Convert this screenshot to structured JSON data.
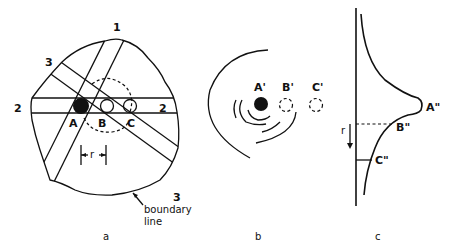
{
  "figure": {
    "panel_a": {
      "caption": "a",
      "projection_labels": {
        "p1": "1",
        "p2_left": "2",
        "p2_right": "2",
        "p3_top": "3",
        "p3_bottom": "3"
      },
      "points": {
        "A": "A",
        "B": "B",
        "C": "C"
      },
      "distance_label": "r",
      "boundary_label_line1": "boundary",
      "boundary_label_line2": "line"
    },
    "panel_b": {
      "caption": "b",
      "points": {
        "A": "A'",
        "B": "B'",
        "C": "C'"
      }
    },
    "panel_c": {
      "caption": "c",
      "points": {
        "A": "A\"",
        "B": "B\"",
        "C": "C\""
      },
      "axis_label": "r"
    }
  }
}
